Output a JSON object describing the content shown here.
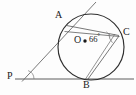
{
  "figure": {
    "stroke_color": "#3a3a3a",
    "fill_color": "none",
    "background": "#fdfdfd",
    "width": 136,
    "height": 95
  },
  "labels": {
    "point_a": "A",
    "point_b": "B",
    "point_c": "C",
    "point_o": "O",
    "point_p": "P",
    "angle_value": "66",
    "angle_degree_symbol": "°"
  },
  "geometry": {
    "circle": {
      "cx": 91,
      "cy": 47,
      "r": 33
    },
    "center_dot": {
      "cx": 85,
      "cy": 41,
      "r": 1.8
    },
    "points": {
      "A": {
        "x": 66,
        "y": 25
      },
      "B": {
        "x": 88,
        "y": 79
      },
      "C": {
        "x": 119,
        "y": 35
      },
      "P": {
        "x": 25,
        "y": 79
      }
    },
    "baseline": {
      "x1": 15,
      "y1": 79,
      "x2": 134,
      "y2": 79
    },
    "tangent_line": {
      "x1": 22,
      "y1": 81,
      "x2": 96,
      "y2": 2
    },
    "chord_ac": {
      "x1": 66,
      "y1": 25,
      "x2": 119,
      "y2": 35
    },
    "chord_cb": {
      "x1": 119,
      "y1": 35,
      "x2": 88,
      "y2": 79
    },
    "chord_ab_lower": {
      "x1": 64,
      "y1": 31,
      "x2": 119,
      "y2": 36
    },
    "angle_arc_p": {
      "cx": 25,
      "cy": 79,
      "r": 9
    },
    "angle_arc_c": {
      "cx": 119,
      "cy": 35,
      "r": 10
    }
  },
  "label_positions": {
    "A": {
      "x": 55,
      "y": 12
    },
    "B": {
      "x": 84,
      "y": 81
    },
    "C": {
      "x": 123,
      "y": 28
    },
    "O": {
      "x": 75,
      "y": 35
    },
    "P": {
      "x": 8,
      "y": 72
    },
    "angle": {
      "x": 90,
      "y": 33
    }
  }
}
